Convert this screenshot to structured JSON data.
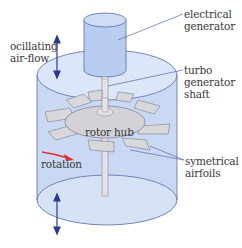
{
  "diagram": {
    "labels": {
      "electrical_generator": [
        "electrical",
        "generator"
      ],
      "oscillating_airflow": [
        "ocillating",
        "air-flow"
      ],
      "turbo_generator_shaft": [
        "turbo",
        "generator",
        "shaft"
      ],
      "rotor_hub": "rotor hub",
      "rotation": "rotation",
      "symmetrical_airfoils": [
        "symetrical",
        "airfoils"
      ]
    },
    "colors": {
      "cylinder_fill": "#c9d9f3",
      "cylinder_top": "#dbe6f8",
      "cylinder_stroke": "#5a6aa8",
      "blade_fill": "#d8d8dc",
      "blade_stroke": "#7a7a86",
      "arrow_airflow": "#2d3a8c",
      "arrow_rotation": "#e03030",
      "leader_line": "#5a6aa8",
      "text": "#3a3a3a"
    }
  }
}
